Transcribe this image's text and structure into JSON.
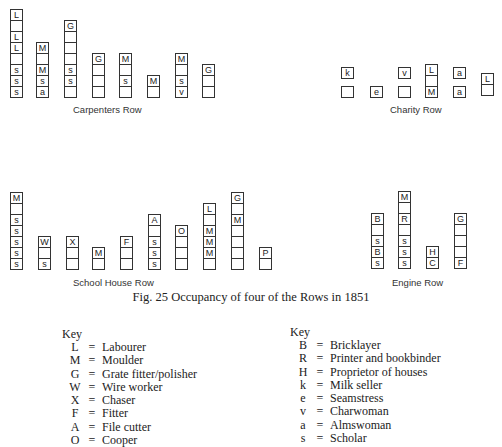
{
  "figure": {
    "caption": "Fig. 25  Occupancy of four of the Rows in 1851"
  },
  "rows": {
    "carpenters": {
      "label": "Carpenters Row",
      "columns": [
        [
          "L",
          "",
          "L",
          "L",
          "",
          "s",
          "s",
          "s"
        ],
        [
          "M",
          "",
          "M",
          "s",
          "a"
        ],
        [
          "G",
          "",
          "",
          "",
          "s",
          "s",
          ""
        ],
        [
          "G",
          "",
          "",
          ""
        ],
        [
          "M",
          "",
          "s",
          ""
        ],
        [
          "M",
          ""
        ],
        [
          "M",
          "",
          "s",
          "v"
        ],
        [
          "G",
          "",
          ""
        ]
      ]
    },
    "charity": {
      "label": "Charity Row",
      "columns": [
        {
          "top": "k",
          "bottom": ""
        },
        {
          "single": "e"
        },
        {
          "top": "v",
          "bottom": ""
        },
        {
          "stack": [
            "L",
            "",
            "M"
          ]
        },
        {
          "top": "a",
          "bottom": "a"
        },
        {
          "stack": [
            "L",
            ""
          ]
        }
      ]
    },
    "school_house": {
      "label": "School House Row",
      "columns": [
        [
          "M",
          "",
          "s",
          "s",
          "s",
          "s",
          "s"
        ],
        [
          "W",
          "",
          "s"
        ],
        [
          "X",
          "",
          ""
        ],
        [
          "M",
          ""
        ],
        [
          "F",
          "",
          ""
        ],
        [
          "A",
          "",
          "s",
          "s",
          "s"
        ],
        [
          "O",
          "",
          "",
          ""
        ],
        [
          "L",
          "",
          "M",
          "M",
          "M",
          ""
        ],
        [
          "G",
          "",
          "M",
          "",
          "",
          "",
          ""
        ],
        [
          "P",
          ""
        ]
      ]
    },
    "engine": {
      "label": "Engine Row",
      "columns": [
        [
          "B",
          "",
          "s",
          "B",
          "s"
        ],
        [
          "M",
          "",
          "R",
          "",
          "s",
          "s",
          "s"
        ],
        [
          "H",
          "C"
        ],
        [
          "G",
          "",
          "",
          "",
          "F"
        ]
      ]
    }
  },
  "key_left": {
    "title": "Key",
    "items": [
      {
        "code": "L",
        "desc": "Labourer"
      },
      {
        "code": "M",
        "desc": "Moulder"
      },
      {
        "code": "G",
        "desc": "Grate fitter/polisher"
      },
      {
        "code": "W",
        "desc": "Wire worker"
      },
      {
        "code": "X",
        "desc": "Chaser"
      },
      {
        "code": "F",
        "desc": "Fitter"
      },
      {
        "code": "A",
        "desc": "File cutter"
      },
      {
        "code": "O",
        "desc": "Cooper"
      }
    ]
  },
  "key_right": {
    "title": "Key",
    "items": [
      {
        "code": "B",
        "desc": "Bricklayer"
      },
      {
        "code": "R",
        "desc": "Printer and bookbinder"
      },
      {
        "code": "H",
        "desc": "Proprietor of houses"
      },
      {
        "code": "k",
        "desc": "Milk seller"
      },
      {
        "code": "e",
        "desc": "Seamstress"
      },
      {
        "code": "v",
        "desc": "Charwoman"
      },
      {
        "code": "a",
        "desc": "Almswoman"
      },
      {
        "code": "s",
        "desc": "Scholar"
      }
    ]
  },
  "key_separator": "="
}
